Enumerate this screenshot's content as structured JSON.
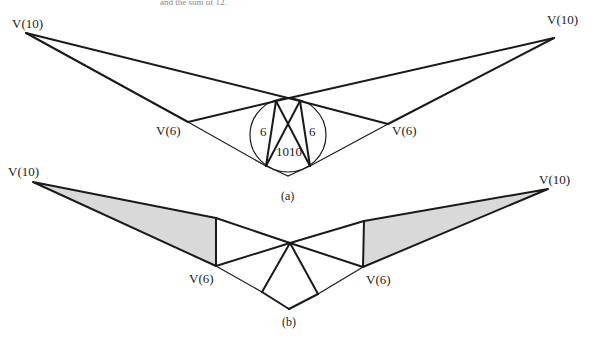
{
  "figure_a": {
    "caption": "(a)",
    "labels": {
      "left_top": "V(10)",
      "right_top": "V(10)",
      "left_mid": "V(6)",
      "right_mid": "V(6)"
    },
    "circle_labels": {
      "left_chord": "6",
      "right_chord": "6",
      "center": "1010"
    }
  },
  "figure_b": {
    "caption": "(b)",
    "labels": {
      "left_top": "V(10)",
      "right_top": "V(10)",
      "left_mid": "V(6)",
      "right_mid": "V(6)"
    }
  },
  "colors": {
    "line": "#1a1a1a",
    "shade": "#d9d9d9",
    "background": "#ffffff"
  }
}
